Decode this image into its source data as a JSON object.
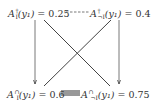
{
  "diagram": {
    "nodes": [
      {
        "id": "top-left",
        "base": "A",
        "sup": "†",
        "sub": "I",
        "arg": "(y₁)",
        "eq": " = ",
        "value": "0.25"
      },
      {
        "id": "top-right",
        "base": "A",
        "sup": "†",
        "sub": "¬I",
        "arg": "(y₁)",
        "eq": " = ",
        "value": "0.4"
      },
      {
        "id": "bottom-left",
        "base": "A",
        "sup": "∩",
        "sub": "I",
        "arg": "(y₁)",
        "eq": " = ",
        "value": "0.6"
      },
      {
        "id": "bottom-right",
        "base": "A",
        "sup": "∩",
        "sub": "¬I",
        "arg": "(y₁)",
        "eq": " = ",
        "value": "0.75"
      }
    ],
    "edges": [
      {
        "from": "top-left",
        "to": "top-right",
        "style": "dashed"
      },
      {
        "from": "bottom-left",
        "to": "bottom-right",
        "style": "thick-double"
      },
      {
        "from": "top-left",
        "to": "bottom-left",
        "style": "arrow"
      },
      {
        "from": "top-right",
        "to": "bottom-right",
        "style": "arrow"
      },
      {
        "from": "top-left",
        "to": "bottom-right",
        "style": "solid"
      },
      {
        "from": "top-right",
        "to": "bottom-left",
        "style": "solid"
      }
    ],
    "colors": {
      "text": "#333333",
      "line": "#444444",
      "background": "#ffffff"
    }
  }
}
